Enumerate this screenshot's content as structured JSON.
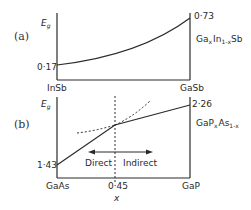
{
  "panel_a": {
    "label": "(a)",
    "y_axis_label": "E",
    "y_axis_sub": "g",
    "left_value": "0·17",
    "right_value": "0·73",
    "left_material": "InSb",
    "right_material": "GaSb",
    "alloy_prefix": "Ga",
    "alloy_x": "x",
    "alloy_mid": "In",
    "alloy_1mx": "1-x",
    "alloy_suffix": "Sb"
  },
  "panel_b": {
    "label": "(b)",
    "y_axis_label": "E",
    "y_axis_sub": "g",
    "left_value": "1·43",
    "right_value": "2·26",
    "left_material": "GaAs",
    "right_material": "GaP",
    "crossover_value": "0·45",
    "direct_label": "Direct",
    "indirect_label": "Indirect",
    "x_axis_label": "x",
    "alloy_prefix": "GaP",
    "alloy_x": "x",
    "alloy_mid": "As",
    "alloy_1mx": "1-x"
  },
  "colors": {
    "line": "#2a2a2a",
    "background": "#ffffff"
  }
}
